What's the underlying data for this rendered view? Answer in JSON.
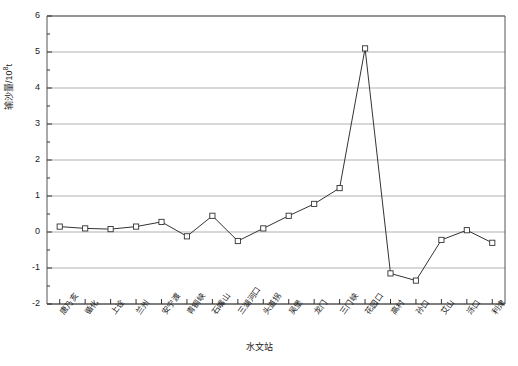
{
  "chart_data": {
    "type": "line",
    "title": "",
    "xlabel": "水文站",
    "ylabel": "输沙量/10⁸t",
    "ylim": [
      -2,
      6
    ],
    "yticks": [
      -2,
      -1,
      0,
      1,
      2,
      3,
      4,
      5,
      6
    ],
    "ytick_labels": [
      "-2",
      "-1",
      "0",
      "1",
      "2",
      "3",
      "4",
      "5",
      "6"
    ],
    "grid": true,
    "legend": "none",
    "marker": "open-square",
    "line_color": "#333333",
    "grid_color": "#a8a8a8",
    "categories": [
      "唐乃亥",
      "循化",
      "上诠",
      "兰州",
      "安宁渡",
      "青铜峡",
      "石嘴山",
      "三湖河口",
      "头道拐",
      "吴堡",
      "龙门",
      "三门峡",
      "花园口",
      "高村",
      "孙口",
      "艾山",
      "泺口",
      "利津"
    ],
    "values": [
      0.15,
      0.1,
      0.08,
      0.15,
      0.28,
      -0.12,
      0.45,
      -0.25,
      0.1,
      0.45,
      0.78,
      1.22,
      5.1,
      -1.15,
      -1.35,
      -0.22,
      0.05,
      -0.3
    ],
    "values_tail": -0.72
  },
  "axis": {
    "y_title": "输沙量/10",
    "y_title_sup": "8",
    "y_title_unit": "t",
    "x_title": "水文站"
  }
}
